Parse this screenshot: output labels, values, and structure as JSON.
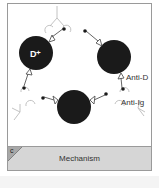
{
  "figure": {
    "panel_letter": "c",
    "caption": "Mechanism",
    "labels": {
      "cell_label": "D⁺",
      "anti_d": "Anti-D",
      "anti_ig": "Anti-Ig"
    },
    "colors": {
      "cell": "#1a1a1a",
      "caption_band": "#d6d6d6",
      "frame": "#9a9a9a",
      "antibody_line": "#555555",
      "anti_ig_line": "#bbbbbb"
    }
  }
}
